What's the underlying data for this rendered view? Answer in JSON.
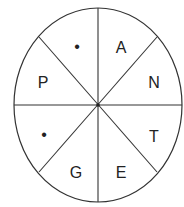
{
  "diagram": {
    "type": "circular letter puzzle",
    "segments": [
      {
        "position": "top-right",
        "label": "A"
      },
      {
        "position": "right-upper",
        "label": "N"
      },
      {
        "position": "right-lower",
        "label": "T"
      },
      {
        "position": "bottom-right",
        "label": "E"
      },
      {
        "position": "bottom-left",
        "label": "G"
      },
      {
        "position": "left-lower",
        "label": "•"
      },
      {
        "position": "left-upper",
        "label": "P"
      },
      {
        "position": "top-left",
        "label": "•"
      }
    ],
    "stroke_color": "#333333",
    "text_color": "#222222"
  }
}
